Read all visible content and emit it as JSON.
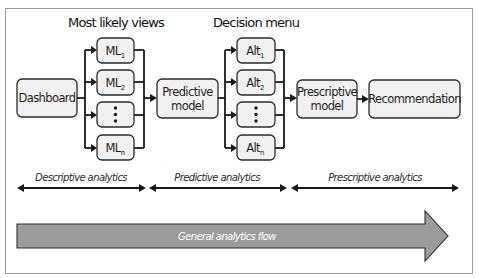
{
  "headings": {
    "most_likely_views": "Most likely views",
    "decision_menu": "Decision menu"
  },
  "nodes": {
    "dashboard": "Dashboard",
    "predictive_model": [
      "Predictive",
      "model"
    ],
    "prescriptive_model": [
      "Prescriptive",
      "model"
    ],
    "recommendation": "Recommendation"
  },
  "most_likely_views": [
    {
      "base": "ML",
      "sub": "1"
    },
    {
      "base": "ML",
      "sub": "2"
    },
    {
      "base": "",
      "sub": "",
      "ellipsis": true
    },
    {
      "base": "ML",
      "sub": "n"
    }
  ],
  "decision_menu": [
    {
      "base": "Alt",
      "sub": "1"
    },
    {
      "base": "Alt",
      "sub": "2"
    },
    {
      "base": "",
      "sub": "",
      "ellipsis": true
    },
    {
      "base": "Alt",
      "sub": "n"
    }
  ],
  "phases": {
    "descriptive": "Descriptive analytics",
    "predictive": "Predictive analytics",
    "prescriptive": "Prescriptive analytics"
  },
  "flow": {
    "label": "General analytics flow"
  },
  "colors": {
    "box_fill": "#f1f1f1",
    "box_stroke": "#2b2b2b",
    "flow_arrow_fill": "#9c9c9c",
    "frame_stroke": "#9a9a9a"
  }
}
